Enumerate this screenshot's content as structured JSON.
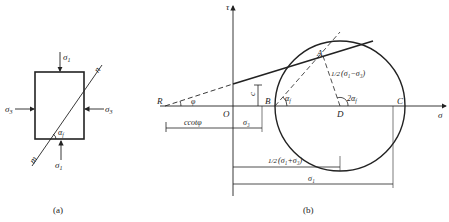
{
  "panel_a": {
    "caption": "(a)",
    "top_stress": "σ",
    "top_stress_sub": "1",
    "bottom_stress": "σ",
    "bottom_stress_sub": "1",
    "left_stress": "σ",
    "left_stress_sub": "3",
    "right_stress": "σ",
    "right_stress_sub": "3",
    "plane_end_top": "n",
    "plane_end_bottom": "m",
    "angle": "α",
    "angle_sub": "f"
  },
  "panel_b": {
    "caption": "(b)",
    "y_axis": "τ",
    "x_axis": "σ",
    "point_R": "R",
    "point_O": "O",
    "point_A": "A",
    "point_B": "B",
    "point_C": "C",
    "point_D": "D",
    "friction_angle": "φ",
    "cohesion": "c",
    "angle_af": "α",
    "angle_af_sub": "f",
    "angle_2af": "2α",
    "angle_2af_sub": "f",
    "radius_label_frac": "1/2",
    "radius_label": "(σ₁−σ₃)",
    "dim_ccot": "ccotφ",
    "dim_sigma3": "σ₃",
    "dim_half_sum_frac": "1/2",
    "dim_half_sum": "(σ₁+σ₃)",
    "dim_sigma1": "σ₁"
  }
}
